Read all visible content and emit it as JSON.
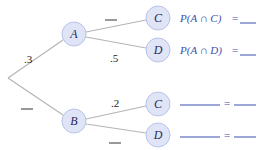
{
  "diagram": {
    "type": "probability-tree",
    "root": {
      "x": 8,
      "y": 78
    },
    "nodes": {
      "A": {
        "label": "A",
        "x": 74,
        "y": 34
      },
      "B": {
        "label": "B",
        "x": 74,
        "y": 121
      },
      "AC": {
        "label": "C",
        "x": 158,
        "y": 18
      },
      "AD": {
        "label": "D",
        "x": 158,
        "y": 50
      },
      "BC": {
        "label": "C",
        "x": 158,
        "y": 104
      },
      "BD": {
        "label": "D",
        "x": 158,
        "y": 135
      }
    },
    "branch_probabilities": {
      "root_A": ".3",
      "root_B": "",
      "A_C": "",
      "A_D": ".5",
      "B_C": ".2",
      "B_D": ""
    },
    "results": {
      "AC": {
        "expression": "P(A ∩ C)",
        "equals": "=",
        "value": ""
      },
      "AD": {
        "expression": "P(A ∩ D)",
        "equals": "=",
        "value": ""
      },
      "BC": {
        "expression": "",
        "equals": "=",
        "value": ""
      },
      "BD": {
        "expression": "",
        "equals": "=",
        "value": ""
      }
    },
    "colors": {
      "node_fill": "#dfe5f7",
      "node_stroke": "#b9c3e6",
      "edge": "#b5b5b5",
      "result_text": "#3a4fb0"
    }
  }
}
